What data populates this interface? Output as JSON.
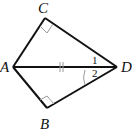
{
  "diagram": {
    "type": "geometry-figure",
    "points": {
      "A": {
        "label": "A",
        "x": 13,
        "y": 67
      },
      "B": {
        "label": "B",
        "x": 47,
        "y": 108
      },
      "C": {
        "label": "C",
        "x": 45,
        "y": 18
      },
      "D": {
        "label": "D",
        "x": 117,
        "y": 67
      }
    },
    "segments": [
      "AC",
      "CD",
      "AD",
      "AB",
      "BD"
    ],
    "right_angles": [
      "C",
      "B"
    ],
    "angle_labels": [
      {
        "label": "1",
        "vertex": "D",
        "between": [
          "DC",
          "DA"
        ]
      },
      {
        "label": "2",
        "vertex": "D",
        "between": [
          "DA",
          "DB"
        ]
      }
    ],
    "marks": {
      "AD_tick": "double tick mark on segment AD (common side)",
      "angle_arc": "arc mark at D for angle 2"
    },
    "colors": {
      "line": "#111111",
      "mark": "#9a9a9a"
    }
  }
}
